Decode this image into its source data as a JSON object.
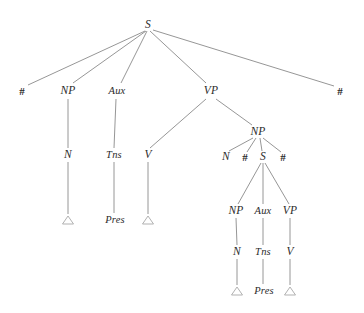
{
  "diagram": {
    "type": "constituency-tree",
    "background_color": "#ffffff",
    "line_color": "#8a8a8a",
    "text_color": "#2b2b2b",
    "triangle_color": "#a8a8a8",
    "nodes": [
      {
        "id": "s-root",
        "label": "S",
        "x": 148,
        "y": 25,
        "kind": "nonterminal"
      },
      {
        "id": "hash-left",
        "label": "#",
        "x": 22,
        "y": 92,
        "kind": "boundary"
      },
      {
        "id": "np-1",
        "label": "NP",
        "x": 68,
        "y": 91,
        "kind": "nonterminal"
      },
      {
        "id": "aux-1",
        "label": "Aux",
        "x": 117,
        "y": 91,
        "kind": "nonterminal"
      },
      {
        "id": "vp-1",
        "label": "VP",
        "x": 211,
        "y": 91,
        "kind": "nonterminal"
      },
      {
        "id": "hash-right",
        "label": "#",
        "x": 340,
        "y": 92,
        "kind": "boundary"
      },
      {
        "id": "n-1",
        "label": "N",
        "x": 68,
        "y": 155,
        "kind": "nonterminal"
      },
      {
        "id": "tns-1",
        "label": "Tns",
        "x": 114,
        "y": 155,
        "kind": "nonterminal"
      },
      {
        "id": "v-1",
        "label": "V",
        "x": 148,
        "y": 155,
        "kind": "nonterminal"
      },
      {
        "id": "np-2",
        "label": "NP",
        "x": 258,
        "y": 132,
        "kind": "nonterminal"
      },
      {
        "id": "n-2",
        "label": "N",
        "x": 226,
        "y": 157,
        "kind": "nonterminal"
      },
      {
        "id": "hash-inner-l",
        "label": "#",
        "x": 245,
        "y": 158,
        "kind": "boundary"
      },
      {
        "id": "s-inner",
        "label": "S",
        "x": 263,
        "y": 157,
        "kind": "nonterminal"
      },
      {
        "id": "hash-inner-r",
        "label": "#",
        "x": 283,
        "y": 158,
        "kind": "boundary"
      },
      {
        "id": "np-3",
        "label": "NP",
        "x": 236,
        "y": 211,
        "kind": "nonterminal"
      },
      {
        "id": "aux-2",
        "label": "Aux",
        "x": 263,
        "y": 211,
        "kind": "nonterminal"
      },
      {
        "id": "vp-2",
        "label": "VP",
        "x": 290,
        "y": 211,
        "kind": "nonterminal"
      },
      {
        "id": "n-3",
        "label": "N",
        "x": 237,
        "y": 252,
        "kind": "nonterminal"
      },
      {
        "id": "tns-2",
        "label": "Tns",
        "x": 263,
        "y": 252,
        "kind": "nonterminal"
      },
      {
        "id": "v-2",
        "label": "V",
        "x": 290,
        "y": 252,
        "kind": "nonterminal"
      },
      {
        "id": "pres-1",
        "label": "Pres",
        "x": 115,
        "y": 220,
        "kind": "terminal"
      },
      {
        "id": "pres-2",
        "label": "Pres",
        "x": 264,
        "y": 291,
        "kind": "terminal"
      }
    ],
    "triangles": [
      {
        "id": "triangle-n-1",
        "x": 68,
        "y": 220
      },
      {
        "id": "triangle-v-1",
        "x": 148,
        "y": 220
      },
      {
        "id": "triangle-n-3",
        "x": 237,
        "y": 291
      },
      {
        "id": "triangle-v-2",
        "x": 290,
        "y": 291
      }
    ],
    "edges": [
      {
        "from": "s-root",
        "to": "hash-left",
        "x1": 145,
        "y1": 31,
        "x2": 28,
        "y2": 85
      },
      {
        "from": "s-root",
        "to": "np-1",
        "x1": 146,
        "y1": 31,
        "x2": 73,
        "y2": 83
      },
      {
        "from": "s-root",
        "to": "aux-1",
        "x1": 147,
        "y1": 31,
        "x2": 121,
        "y2": 83
      },
      {
        "from": "s-root",
        "to": "vp-1",
        "x1": 150,
        "y1": 31,
        "x2": 206,
        "y2": 83
      },
      {
        "from": "s-root",
        "to": "hash-right",
        "x1": 153,
        "y1": 30,
        "x2": 334,
        "y2": 86
      },
      {
        "from": "np-1",
        "to": "n-1",
        "x1": 68,
        "y1": 99,
        "x2": 68,
        "y2": 148
      },
      {
        "from": "aux-1",
        "to": "tns-1",
        "x1": 116,
        "y1": 99,
        "x2": 114,
        "y2": 148
      },
      {
        "from": "vp-1",
        "to": "v-1",
        "x1": 206,
        "y1": 99,
        "x2": 150,
        "y2": 148
      },
      {
        "from": "vp-1",
        "to": "np-2",
        "x1": 216,
        "y1": 99,
        "x2": 252,
        "y2": 125
      },
      {
        "from": "n-1",
        "to": "triangle-n-1",
        "x1": 68,
        "y1": 162,
        "x2": 68,
        "y2": 214
      },
      {
        "from": "tns-1",
        "to": "pres-1",
        "x1": 114,
        "y1": 162,
        "x2": 114,
        "y2": 213
      },
      {
        "from": "v-1",
        "to": "triangle-v-1",
        "x1": 148,
        "y1": 162,
        "x2": 148,
        "y2": 214
      },
      {
        "from": "np-2",
        "to": "n-2",
        "x1": 253,
        "y1": 138,
        "x2": 229,
        "y2": 151
      },
      {
        "from": "np-2",
        "to": "hash-inner-l",
        "x1": 256,
        "y1": 138,
        "x2": 247,
        "y2": 152
      },
      {
        "from": "np-2",
        "to": "s-inner",
        "x1": 260,
        "y1": 138,
        "x2": 262,
        "y2": 151
      },
      {
        "from": "np-2",
        "to": "hash-inner-r",
        "x1": 263,
        "y1": 138,
        "x2": 281,
        "y2": 152
      },
      {
        "from": "s-inner",
        "to": "np-3",
        "x1": 261,
        "y1": 163,
        "x2": 238,
        "y2": 204
      },
      {
        "from": "s-inner",
        "to": "aux-2",
        "x1": 263,
        "y1": 163,
        "x2": 263,
        "y2": 204
      },
      {
        "from": "s-inner",
        "to": "vp-2",
        "x1": 265,
        "y1": 163,
        "x2": 289,
        "y2": 204
      },
      {
        "from": "np-3",
        "to": "n-3",
        "x1": 236,
        "y1": 218,
        "x2": 237,
        "y2": 245
      },
      {
        "from": "aux-2",
        "to": "tns-2",
        "x1": 263,
        "y1": 218,
        "x2": 263,
        "y2": 245
      },
      {
        "from": "vp-2",
        "to": "v-2",
        "x1": 290,
        "y1": 218,
        "x2": 290,
        "y2": 245
      },
      {
        "from": "n-3",
        "to": "triangle-n-3",
        "x1": 237,
        "y1": 259,
        "x2": 237,
        "y2": 285
      },
      {
        "from": "tns-2",
        "to": "pres-2",
        "x1": 263,
        "y1": 259,
        "x2": 263,
        "y2": 284
      },
      {
        "from": "v-2",
        "to": "triangle-v-2",
        "x1": 290,
        "y1": 259,
        "x2": 290,
        "y2": 285
      }
    ]
  }
}
